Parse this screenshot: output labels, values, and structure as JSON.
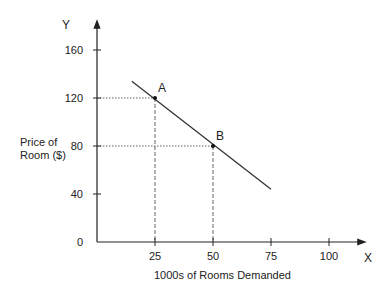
{
  "chart_data": {
    "type": "line",
    "title": "",
    "xlabel": "1000s of Rooms Demanded",
    "ylabel": "Price of Room ($)",
    "ylabel_lines": [
      "Price of",
      "Room ($)"
    ],
    "x_axis_letter": "X",
    "y_axis_letter": "Y",
    "x_ticks": [
      25,
      50,
      75,
      100
    ],
    "y_ticks": [
      0,
      40,
      80,
      120,
      160
    ],
    "xlim": [
      0,
      110
    ],
    "ylim": [
      0,
      180
    ],
    "grid": false,
    "series": [
      {
        "name": "Demand curve",
        "x": [
          15,
          75
        ],
        "y": [
          134,
          44
        ],
        "color": "#333333"
      }
    ],
    "points": [
      {
        "label": "A",
        "x": 25,
        "y": 120
      },
      {
        "label": "B",
        "x": 50,
        "y": 80
      }
    ]
  }
}
